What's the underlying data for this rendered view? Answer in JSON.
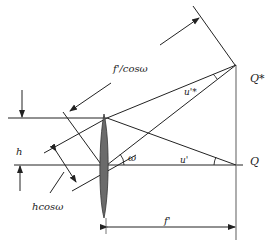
{
  "labels": {
    "f_over_cos": "f'/cosω",
    "u_star": "u'*",
    "u_prime": "u'",
    "omega": "ω",
    "h": "h",
    "h_cos": "hcosω",
    "Q_star": "Q*",
    "Q": "Q",
    "f_prime": "f'"
  },
  "colors": {
    "line": "#222222",
    "lens_fill": "#6b6b6b",
    "focal_plane": "#777777"
  }
}
